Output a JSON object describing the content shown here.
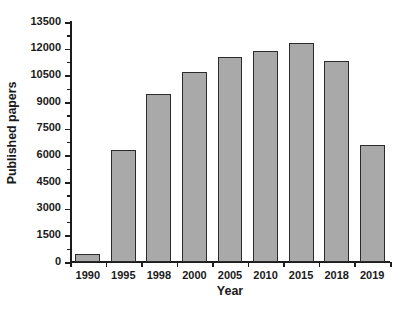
{
  "chart_data": {
    "type": "bar",
    "title": "",
    "xlabel": "Year",
    "ylabel": "Published papers",
    "categories": [
      "1990",
      "1995",
      "1998",
      "2000",
      "2005",
      "2010",
      "2015",
      "2018",
      "2019"
    ],
    "values": [
      450,
      6300,
      9450,
      10700,
      11550,
      11850,
      12300,
      11300,
      6600
    ],
    "ylim": [
      0,
      13500
    ],
    "ytick_labels": [
      "0",
      "1500",
      "3000",
      "4500",
      "6000",
      "7500",
      "9000",
      "10500",
      "12000",
      "13500"
    ],
    "ytick_values": [
      0,
      1500,
      3000,
      4500,
      6000,
      7500,
      9000,
      10500,
      12000,
      13500
    ],
    "ytick_minor_step": 750,
    "grid": false,
    "legend": null,
    "legend_position": "none",
    "bar_fill_color": "#a9a9a9",
    "bar_edge_color": "#2b2b2b",
    "axis_color": "#1c1c1c",
    "background_color": "#ffffff"
  }
}
